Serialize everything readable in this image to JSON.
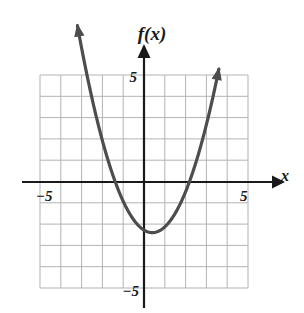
{
  "figure": {
    "background_color": "#ffffff",
    "width": 304,
    "height": 313
  },
  "labels": {
    "function_label": "f(x)",
    "x_axis_label": "x",
    "y_axis_top_tick": "5",
    "y_axis_bottom_tick": "−5",
    "x_axis_left_tick": "−5",
    "x_axis_right_tick": "5"
  },
  "style": {
    "grid_color": "#b3b3b3",
    "axis_color": "#1a1a1a",
    "curve_color": "#4d4d4d",
    "text_color": "#1a1a1a",
    "curve_width": 3.2,
    "axis_width": 2.2,
    "grid_width": 1
  },
  "chart_data": {
    "type": "line",
    "title": "",
    "subtitle": "",
    "xlabel": "x",
    "ylabel": "f(x)",
    "xlim": [
      -5,
      5
    ],
    "ylim": [
      -5,
      5
    ],
    "grid": true,
    "grid_step": 1,
    "legend": "none",
    "annotations": [],
    "xticks": [
      -5,
      5
    ],
    "yticks": [
      -5,
      5
    ],
    "xtick_labels": [
      "−5",
      "5"
    ],
    "ytick_labels": [
      "−5",
      "5"
    ],
    "series": [
      {
        "name": "f(x)",
        "shape": "parabola",
        "opens": "upward",
        "vertex": [
          0.4,
          -2.4
        ],
        "leading_coefficient": 0.75,
        "equation": "f(x) = 0.75(x - 0.4)^2 - 2.4",
        "x_intercepts": [
          -1.4,
          2.2
        ],
        "y_intercept": -2.3,
        "domain_drawn": [
          -3.2,
          3.6
        ],
        "arrow_ends": [
          "left-up",
          "right-up"
        ],
        "x": [
          -3.2,
          -2.8,
          -2.4,
          -2.0,
          -1.6,
          -1.2,
          -0.8,
          -0.4,
          0.0,
          0.4,
          0.8,
          1.2,
          1.6,
          2.0,
          2.4,
          2.8,
          3.2,
          3.6
        ],
        "y": [
          9.7,
          7.7,
          5.9,
          4.3,
          0.0,
          -0.5,
          -1.3,
          -1.9,
          -2.3,
          -2.4,
          -2.3,
          -1.9,
          -1.3,
          -0.5,
          0.6,
          1.9,
          3.5,
          5.3
        ]
      }
    ]
  }
}
